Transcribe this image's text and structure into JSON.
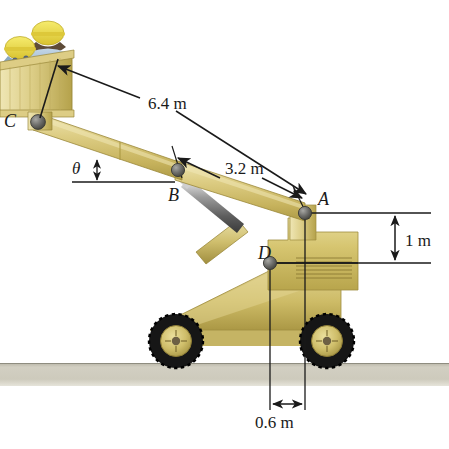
{
  "figure": {
    "background_color": "#ffffff"
  },
  "colors": {
    "boom_light": "#e2d79a",
    "boom_mid": "#cfbe6d",
    "boom_dark": "#b5a049",
    "body_yellow": "#d8c86f",
    "body_shadow": "#b3a14a",
    "tire_black": "#1b1b1b",
    "hub_yellow": "#d5c46b",
    "ground_gray": "#c9c6b8",
    "line_black": "#1a1a1a",
    "joint_gray": "#6a6a68",
    "helmet_yellow": "#e8d54a",
    "shirt_blue": "#9fb9cf",
    "skin_dark": "#6b5742"
  },
  "labels": {
    "point_a": "A",
    "point_b": "B",
    "point_c": "C",
    "point_d": "D",
    "theta": "θ"
  },
  "dimensions": [
    {
      "id": "len_basket_to_a",
      "text": "6.4 m",
      "value": 6.4,
      "unit": "m",
      "from": "basket",
      "to": "A"
    },
    {
      "id": "len_b_to_a",
      "text": "3.2 m",
      "value": 3.2,
      "unit": "m",
      "from": "B",
      "to": "A"
    },
    {
      "id": "height_a_above_d",
      "text": "1 m",
      "value": 1,
      "unit": "m",
      "orientation": "vertical"
    },
    {
      "id": "horiz_d_to_a",
      "text": "0.6 m",
      "value": 0.6,
      "unit": "m",
      "orientation": "horizontal"
    }
  ],
  "joints": [
    {
      "name": "A",
      "x": 305,
      "y": 213
    },
    {
      "name": "B",
      "x": 178,
      "y": 170
    },
    {
      "name": "C",
      "x": 38,
      "y": 122
    },
    {
      "name": "D",
      "x": 270,
      "y": 263
    }
  ],
  "occupants": [
    {
      "name": "worker-front",
      "helmet": "yellow hard hat",
      "shirt": "blue"
    },
    {
      "name": "worker-rear",
      "helmet": "yellow hard hat",
      "shirt": "blue"
    }
  ],
  "ground": {
    "label": "ground surface",
    "top": 363,
    "bottom": 386
  }
}
